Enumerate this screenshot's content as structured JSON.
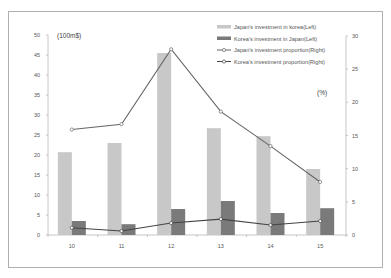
{
  "chart_data": {
    "type": "bar",
    "title": "",
    "categories": [
      "10",
      "11",
      "12",
      "13",
      "14",
      "15"
    ],
    "xlabel": "",
    "ylabel_left": "(100m$)",
    "ylabel_right": "(%)",
    "ylim_left": [
      0,
      50
    ],
    "ylim_right": [
      0,
      30
    ],
    "yticks_left": [
      0,
      5,
      10,
      15,
      20,
      25,
      30,
      35,
      40,
      45,
      50
    ],
    "yticks_right": [
      0,
      5,
      10,
      15,
      20,
      25,
      30
    ],
    "grid": false,
    "legend_position": "top-right",
    "series": [
      {
        "name": "Japan's investment in korea(Left)",
        "type": "bar",
        "axis": "left",
        "color": "#c8c8c8",
        "values": [
          20.7,
          23.0,
          45.5,
          26.7,
          24.7,
          16.5
        ]
      },
      {
        "name": "Korea's investment in Japan(Left)",
        "type": "bar",
        "axis": "left",
        "color": "#7a7a7a",
        "values": [
          3.5,
          2.7,
          6.5,
          8.5,
          5.5,
          6.7
        ]
      },
      {
        "name": "Japan's investment proportion(Right)",
        "type": "line",
        "axis": "right",
        "color": "#666666",
        "values": [
          15.9,
          16.7,
          28.0,
          18.6,
          13.4,
          8.0
        ]
      },
      {
        "name": "Korea's investment proportion(Right)",
        "type": "line",
        "axis": "right",
        "color": "#444444",
        "values": [
          1.1,
          0.6,
          1.8,
          2.4,
          1.5,
          2.1
        ]
      }
    ]
  },
  "labels": {
    "unit_left": "(100m$)",
    "unit_right": "(%)"
  },
  "colors": {
    "frame": "#b0b0b0",
    "axis": "#b8b8b8",
    "light_bar": "#c8c8c8",
    "dark_bar": "#7a7a7a",
    "line": "#5a5a5a"
  }
}
